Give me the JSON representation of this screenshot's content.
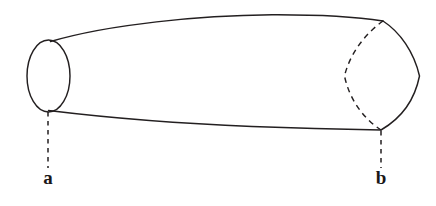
{
  "figure": {
    "background_color": "#ffffff",
    "line_color": "#231f20",
    "width": 436,
    "height": 206
  },
  "labels": {
    "left": {
      "text": "a",
      "x": 48,
      "y": 184
    },
    "right": {
      "text": "b",
      "x": 381,
      "y": 184
    }
  },
  "geometry": {
    "left_cap": {
      "shape": "ellipse",
      "center_x": 48.5,
      "center_y": 76,
      "radius_x": 21.5,
      "radius_y": 36,
      "style": "solid"
    },
    "top_edge": {
      "shape": "curve",
      "start": [
        50,
        41
      ],
      "end": [
        383,
        21
      ],
      "peak_y": 15,
      "style": "solid"
    },
    "bottom_edge": {
      "shape": "curve",
      "start": [
        48,
        110
      ],
      "end": [
        381,
        130
      ],
      "style": "solid"
    },
    "right_cap_front": {
      "shape": "curve",
      "start": [
        383,
        21
      ],
      "end": [
        381,
        130
      ],
      "extreme_x": 420,
      "style": "solid"
    },
    "right_cap_back": {
      "shape": "curve",
      "start": [
        383,
        21
      ],
      "end": [
        381,
        130
      ],
      "extreme_x": 344,
      "style": "dashed"
    },
    "leader_left": {
      "from": [
        48,
        112
      ],
      "to": [
        48,
        168
      ],
      "style": "dashed"
    },
    "leader_right": {
      "from": [
        381,
        131
      ],
      "to": [
        381,
        168
      ],
      "style": "dashed"
    }
  }
}
